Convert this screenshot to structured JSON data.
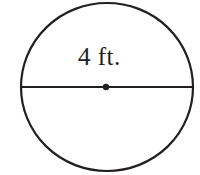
{
  "figure": {
    "kind": "circle-diameter-diagram",
    "background_color": "#ffffff",
    "stroke_color": "#231f20",
    "label": "4 ft.",
    "label_text": "4 ft.",
    "measurement_value": "4",
    "measurement_unit": "ft.",
    "circle": {
      "center_x": 107,
      "center_y": 87,
      "radius_x": 86,
      "radius_y": 84,
      "stroke_width": 2.2
    },
    "diameter_line": {
      "x1": 21,
      "y1": 87,
      "x2": 193,
      "y2": 87,
      "stroke_width": 2
    },
    "center_dot": {
      "cx": 106,
      "cy": 87,
      "r": 3.2
    }
  }
}
